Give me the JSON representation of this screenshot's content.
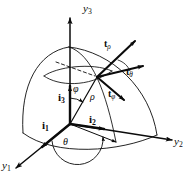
{
  "figure": {
    "background_color": "#ffffff",
    "line_color": "#0b0b0b"
  },
  "axes": [
    {
      "name": "y1",
      "symbol": "y",
      "subscript": "1",
      "label": "y₁",
      "direction": "lower-left"
    },
    {
      "name": "y2",
      "symbol": "y",
      "subscript": "2",
      "label": "y₂",
      "direction": "right"
    },
    {
      "name": "y3",
      "symbol": "y",
      "subscript": "3",
      "label": "y₃",
      "direction": "up"
    }
  ],
  "basis_vectors": [
    {
      "name": "i1",
      "symbol": "i",
      "subscript": "1",
      "label": "i₁"
    },
    {
      "name": "i2",
      "symbol": "i",
      "subscript": "2",
      "label": "i₂"
    },
    {
      "name": "i3",
      "symbol": "i",
      "subscript": "3",
      "label": "i₃"
    }
  ],
  "tangent_vectors": [
    {
      "name": "t-rho",
      "symbol": "t",
      "subscript": "ρ",
      "label": "tρ"
    },
    {
      "name": "t-theta",
      "symbol": "t",
      "subscript": "θ",
      "label": "tθ"
    },
    {
      "name": "t-phi",
      "symbol": "t",
      "subscript": "φ",
      "label": "tφ"
    }
  ],
  "angles": [
    {
      "name": "phi",
      "symbol": "φ",
      "description": "polar angle from y3 axis"
    },
    {
      "name": "theta",
      "symbol": "θ",
      "description": "azimuthal angle in y1-y2 plane"
    }
  ],
  "radial": {
    "name": "rho",
    "symbol": "ρ",
    "description": "radial distance"
  }
}
